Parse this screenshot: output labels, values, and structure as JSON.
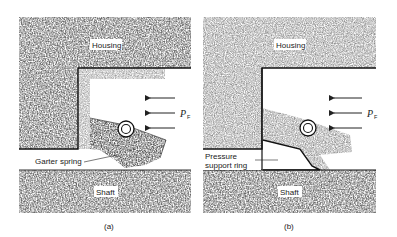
{
  "figure": {
    "panels": [
      {
        "id": "a",
        "caption": "(a)",
        "labels": {
          "housing": "Housing",
          "shaft": "Shaft",
          "callout": "Garter spring",
          "pressure_symbol": "P",
          "pressure_subscript": "F"
        }
      },
      {
        "id": "b",
        "caption": "(b)",
        "labels": {
          "housing": "Housing",
          "shaft": "Shaft",
          "callout_line1": "Pressure",
          "callout_line2": "support ring",
          "pressure_symbol": "P",
          "pressure_subscript": "F"
        }
      }
    ],
    "colors": {
      "hatch_dark": "#3a3a3a",
      "hatch_mid": "#8a8a8a",
      "hatch_light": "#d0d0d0",
      "outline": "#111111",
      "background": "#ffffff"
    }
  }
}
